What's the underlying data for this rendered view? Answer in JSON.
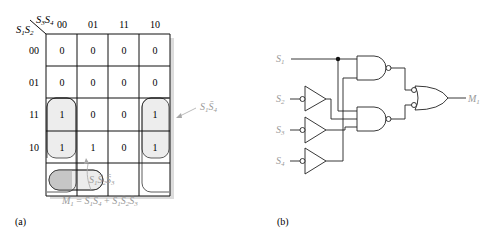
{
  "kmap": {
    "row_var_label": "S1S2",
    "col_var_label": "S3S4",
    "col_headers": [
      "00",
      "01",
      "11",
      "10"
    ],
    "row_headers": [
      "00",
      "01",
      "11",
      "10"
    ],
    "cells": [
      [
        "0",
        "0",
        "0",
        "0"
      ],
      [
        "0",
        "0",
        "0",
        "0"
      ],
      [
        "1",
        "0",
        "0",
        "1"
      ],
      [
        "1",
        "1",
        "0",
        "1"
      ]
    ],
    "group1_label": "S1S̄4",
    "group2_label": "S1S̄2S̄3",
    "equation": "M1 = S1S̄4 + S1S̄2S̄3",
    "caption": "(a)"
  },
  "circuit": {
    "inputs": [
      "S1",
      "S2",
      "S3",
      "S4"
    ],
    "output": "M1",
    "caption": "(b)"
  },
  "colors": {
    "line": "#222222",
    "label_gray": "#9a9a9a",
    "group_fill": "#ececec",
    "group_dark_fill": "#c8c8c8",
    "shadow": "#d8d8d8"
  }
}
